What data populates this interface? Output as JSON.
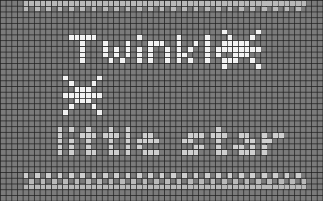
{
  "pattern": {
    "title": "Twinkle little star",
    "type": "cross-stitch pixel chart",
    "colors": {
      "background": "#7b7b7b",
      "gridline": "#2a2a2a",
      "stitch_bright": "#f2f2f2",
      "stitch_light": "#cfcfcf",
      "border_light": "#b9b9b9"
    },
    "text_line_1": "Twinkle",
    "text_line_2": "little star",
    "motifs": [
      "star-icon",
      "star-icon"
    ],
    "border": "checkered light border rows at top and bottom"
  }
}
